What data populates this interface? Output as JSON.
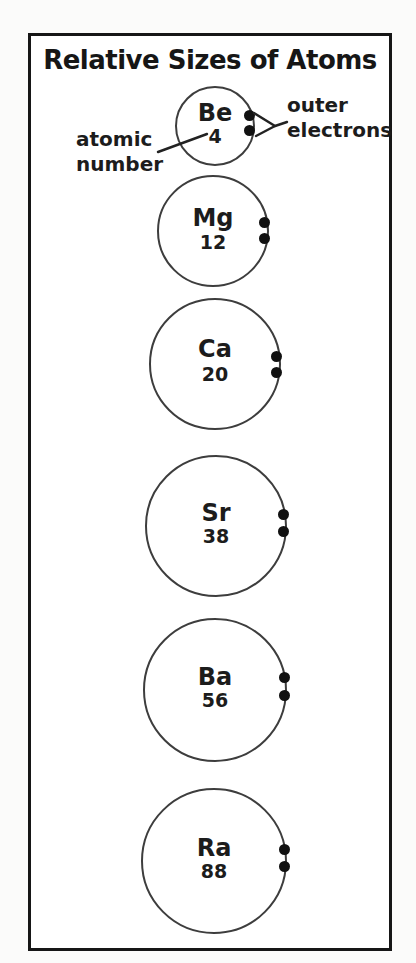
{
  "title": "Relative Sizes of Atoms",
  "labels": {
    "atomic_number": "atomic number",
    "outer_electrons": "outer electrons"
  },
  "atoms": [
    {
      "symbol": "Be",
      "atomic_number": "4"
    },
    {
      "symbol": "Mg",
      "atomic_number": "12"
    },
    {
      "symbol": "Ca",
      "atomic_number": "20"
    },
    {
      "symbol": "Sr",
      "atomic_number": "38"
    },
    {
      "symbol": "Ba",
      "atomic_number": "56"
    },
    {
      "symbol": "Ra",
      "atomic_number": "88"
    }
  ],
  "icons": {
    "outer_electron_dot": "filled-circle"
  },
  "colors": {
    "ink": "#1c1c1c",
    "circle_stroke": "#3d3d3d",
    "frame_border": "#161616",
    "background": "#ffffff"
  }
}
